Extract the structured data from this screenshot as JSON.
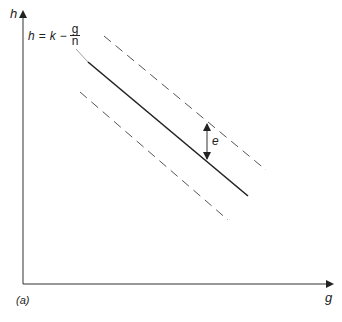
{
  "diagram": {
    "panel_label": "(a)",
    "axes": {
      "y_label": "h",
      "x_label": "g"
    },
    "equation": {
      "lhs": "h",
      "equals": "=",
      "k": "k",
      "minus": "−",
      "numerator": "g",
      "denominator": "n"
    },
    "annotation": {
      "e_label": "e"
    },
    "lines": [
      {
        "name": "central-line",
        "style": "solid",
        "from": [
          88,
          62
        ],
        "to": [
          248,
          196
        ]
      },
      {
        "name": "upper-bound",
        "style": "dashed",
        "from": [
          104,
          36
        ],
        "to": [
          266,
          170
        ]
      },
      {
        "name": "lower-bound",
        "style": "dashed",
        "from": [
          80,
          92
        ],
        "to": [
          228,
          220
        ]
      }
    ],
    "colors": {
      "line": "#222222",
      "dashed": "#555555",
      "leader": "#888888"
    }
  }
}
